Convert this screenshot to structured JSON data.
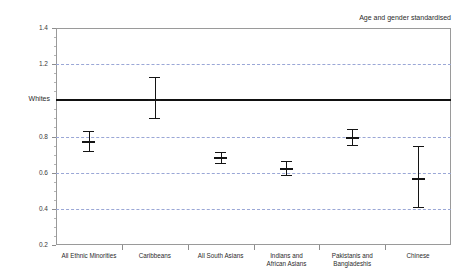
{
  "chart_data": {
    "type": "scatter",
    "title": "",
    "annotation": "Age and gender standardised",
    "xlabel": "",
    "ylabel": "",
    "reference_line": {
      "label": "Whites",
      "value": 1.0
    },
    "ylim": [
      0.2,
      1.4
    ],
    "ytick_labels": [
      "1.4",
      "1.2",
      "0.8",
      "0.6",
      "0.4",
      "0.2"
    ],
    "yticks": [
      1.4,
      1.2,
      0.8,
      0.6,
      0.4,
      0.2
    ],
    "ytick_minor_step": 0.05,
    "gridlines": [
      1.2,
      0.8,
      0.6,
      0.4
    ],
    "grid": true,
    "legend": "none",
    "categories": [
      "All Ethnic Minorities",
      "Caribbeans",
      "All South Asians",
      "Indians and African Asians",
      "Pakistanis and Bangladeshis",
      "Chinese"
    ],
    "values": [
      0.775,
      1.005,
      0.685,
      0.625,
      0.795,
      0.57
    ],
    "ci_low": [
      0.72,
      0.9,
      0.655,
      0.585,
      0.755,
      0.41
    ],
    "ci_high": [
      0.83,
      1.13,
      0.715,
      0.665,
      0.84,
      0.75
    ],
    "series": [
      {
        "name": "Age and gender standardised ratio",
        "points": [
          {
            "category": "All Ethnic Minorities",
            "value": 0.775,
            "low": 0.72,
            "high": 0.83
          },
          {
            "category": "Caribbeans",
            "value": 1.005,
            "low": 0.9,
            "high": 1.13
          },
          {
            "category": "All South Asians",
            "value": 0.685,
            "low": 0.655,
            "high": 0.715
          },
          {
            "category": "Indians and African Asians",
            "value": 0.625,
            "low": 0.585,
            "high": 0.665
          },
          {
            "category": "Pakistanis and Bangladeshis",
            "value": 0.795,
            "low": 0.755,
            "high": 0.84
          },
          {
            "category": "Chinese",
            "value": 0.57,
            "low": 0.41,
            "high": 0.75
          }
        ]
      }
    ],
    "colors": {
      "marker": "#141414",
      "reference_line": "#111111",
      "grid": "#9aa7d6",
      "frame": "#9a9a9a",
      "text": "#2b2b2b"
    }
  }
}
